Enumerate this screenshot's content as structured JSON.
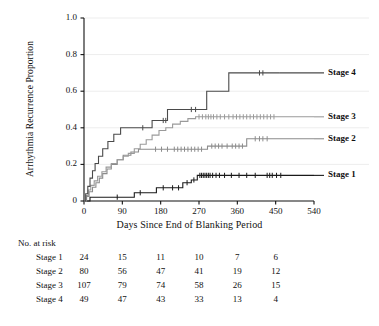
{
  "chart_data": {
    "type": "line",
    "title": "",
    "xlabel": "Days Since End of Blanking Period",
    "ylabel": "Arrhythmia Recurrence Proportion",
    "xlim": [
      0,
      540
    ],
    "ylim": [
      0,
      1.0
    ],
    "xticks": [
      "0",
      "90",
      "180",
      "270",
      "360",
      "450",
      "540"
    ],
    "xtick_values": [
      0,
      90,
      180,
      270,
      360,
      450,
      540
    ],
    "yticks": [
      "0",
      "0.2",
      "0.4",
      "0.6",
      "0.8",
      "1.0"
    ],
    "ytick_values": [
      0,
      0.2,
      0.4,
      0.6,
      0.8,
      1.0
    ],
    "grid": "horizontal",
    "legend_position": "right-of-curve-ends",
    "series": [
      {
        "name": "Stage 1",
        "color": "#1a1a1a",
        "final_value": 0.14,
        "steps": [
          [
            0,
            0.0
          ],
          [
            14,
            0.0
          ],
          [
            14,
            0.021
          ],
          [
            70,
            0.021
          ],
          [
            70,
            0.021
          ],
          [
            118,
            0.021
          ],
          [
            118,
            0.045
          ],
          [
            150,
            0.045
          ],
          [
            150,
            0.045
          ],
          [
            170,
            0.045
          ],
          [
            170,
            0.072
          ],
          [
            196,
            0.072
          ],
          [
            196,
            0.072
          ],
          [
            232,
            0.072
          ],
          [
            232,
            0.1
          ],
          [
            252,
            0.1
          ],
          [
            252,
            0.115
          ],
          [
            266,
            0.115
          ],
          [
            266,
            0.14
          ],
          [
            290,
            0.14
          ],
          [
            540,
            0.14
          ]
        ],
        "censor_marks": [
          78,
          132,
          186,
          208,
          222,
          242,
          258,
          272,
          276,
          280,
          284,
          288,
          292,
          296,
          302,
          310,
          318,
          330,
          346,
          364,
          382,
          402,
          430,
          436,
          442,
          452,
          462
        ]
      },
      {
        "name": "Stage 2",
        "color": "#8c8c8c",
        "final_value": 0.34,
        "steps": [
          [
            0,
            0.0
          ],
          [
            6,
            0.0
          ],
          [
            6,
            0.025
          ],
          [
            12,
            0.025
          ],
          [
            12,
            0.05
          ],
          [
            20,
            0.05
          ],
          [
            20,
            0.075
          ],
          [
            28,
            0.075
          ],
          [
            28,
            0.1
          ],
          [
            36,
            0.1
          ],
          [
            36,
            0.125
          ],
          [
            44,
            0.125
          ],
          [
            44,
            0.15
          ],
          [
            54,
            0.15
          ],
          [
            54,
            0.175
          ],
          [
            64,
            0.175
          ],
          [
            64,
            0.2
          ],
          [
            78,
            0.2
          ],
          [
            78,
            0.225
          ],
          [
            92,
            0.225
          ],
          [
            92,
            0.25
          ],
          [
            110,
            0.25
          ],
          [
            110,
            0.268
          ],
          [
            128,
            0.268
          ],
          [
            128,
            0.283
          ],
          [
            160,
            0.283
          ],
          [
            290,
            0.283
          ],
          [
            290,
            0.3
          ],
          [
            300,
            0.3
          ],
          [
            382,
            0.3
          ],
          [
            382,
            0.34
          ],
          [
            396,
            0.34
          ],
          [
            540,
            0.34
          ]
        ],
        "censor_marks": [
          168,
          182,
          196,
          212,
          220,
          228,
          236,
          244,
          252,
          260,
          268,
          276,
          300,
          308,
          316,
          324,
          336,
          348,
          356,
          364,
          372,
          402,
          412,
          420,
          430
        ]
      },
      {
        "name": "Stage 3",
        "color": "#9a9a9a",
        "final_value": 0.46,
        "steps": [
          [
            0,
            0.0
          ],
          [
            5,
            0.0
          ],
          [
            5,
            0.03
          ],
          [
            10,
            0.03
          ],
          [
            10,
            0.06
          ],
          [
            16,
            0.06
          ],
          [
            16,
            0.085
          ],
          [
            24,
            0.085
          ],
          [
            24,
            0.11
          ],
          [
            32,
            0.11
          ],
          [
            32,
            0.135
          ],
          [
            42,
            0.135
          ],
          [
            42,
            0.16
          ],
          [
            52,
            0.16
          ],
          [
            52,
            0.185
          ],
          [
            64,
            0.185
          ],
          [
            64,
            0.205
          ],
          [
            78,
            0.205
          ],
          [
            78,
            0.225
          ],
          [
            92,
            0.225
          ],
          [
            92,
            0.245
          ],
          [
            104,
            0.245
          ],
          [
            104,
            0.26
          ],
          [
            118,
            0.26
          ],
          [
            118,
            0.285
          ],
          [
            132,
            0.285
          ],
          [
            132,
            0.31
          ],
          [
            146,
            0.31
          ],
          [
            146,
            0.335
          ],
          [
            160,
            0.335
          ],
          [
            160,
            0.36
          ],
          [
            176,
            0.36
          ],
          [
            176,
            0.385
          ],
          [
            192,
            0.385
          ],
          [
            192,
            0.4
          ],
          [
            208,
            0.4
          ],
          [
            208,
            0.42
          ],
          [
            226,
            0.42
          ],
          [
            226,
            0.435
          ],
          [
            244,
            0.435
          ],
          [
            244,
            0.45
          ],
          [
            262,
            0.45
          ],
          [
            262,
            0.46
          ],
          [
            276,
            0.46
          ],
          [
            540,
            0.46
          ]
        ],
        "censor_marks": [
          270,
          278,
          286,
          292,
          298,
          304,
          312,
          320,
          330,
          340,
          350,
          358,
          366,
          374,
          382,
          390,
          398,
          406,
          414,
          422,
          430,
          438,
          446
        ]
      },
      {
        "name": "Stage 4",
        "color": "#4a4a4a",
        "final_value": 0.7,
        "steps": [
          [
            0,
            0.0
          ],
          [
            4,
            0.0
          ],
          [
            4,
            0.04
          ],
          [
            9,
            0.04
          ],
          [
            9,
            0.08
          ],
          [
            14,
            0.08
          ],
          [
            14,
            0.125
          ],
          [
            20,
            0.125
          ],
          [
            20,
            0.165
          ],
          [
            26,
            0.165
          ],
          [
            26,
            0.205
          ],
          [
            34,
            0.205
          ],
          [
            34,
            0.245
          ],
          [
            44,
            0.245
          ],
          [
            44,
            0.285
          ],
          [
            56,
            0.285
          ],
          [
            56,
            0.325
          ],
          [
            70,
            0.325
          ],
          [
            70,
            0.365
          ],
          [
            86,
            0.365
          ],
          [
            86,
            0.4
          ],
          [
            104,
            0.4
          ],
          [
            160,
            0.4
          ],
          [
            160,
            0.44
          ],
          [
            196,
            0.44
          ],
          [
            196,
            0.5
          ],
          [
            288,
            0.5
          ],
          [
            288,
            0.6
          ],
          [
            340,
            0.6
          ],
          [
            340,
            0.7
          ],
          [
            404,
            0.7
          ],
          [
            460,
            0.7
          ]
        ],
        "censor_marks": [
          138,
          186,
          192,
          252,
          262,
          412,
          420
        ]
      }
    ]
  },
  "risk_table": {
    "title": "No. at risk",
    "time_points": [
      0,
      90,
      180,
      270,
      360,
      450
    ],
    "rows": [
      {
        "label": "Stage 1",
        "values": [
          "24",
          "15",
          "11",
          "10",
          "7",
          "6"
        ]
      },
      {
        "label": "Stage 2",
        "values": [
          "80",
          "56",
          "47",
          "41",
          "19",
          "12"
        ]
      },
      {
        "label": "Stage 3",
        "values": [
          "107",
          "79",
          "74",
          "58",
          "26",
          "15"
        ]
      },
      {
        "label": "Stage 4",
        "values": [
          "49",
          "47",
          "43",
          "33",
          "13",
          "4"
        ]
      }
    ]
  },
  "legend": [
    {
      "label": "Stage 4",
      "value": 0.7
    },
    {
      "label": "Stage 3",
      "value": 0.46
    },
    {
      "label": "Stage 2",
      "value": 0.34
    },
    {
      "label": "Stage 1",
      "value": 0.14
    }
  ]
}
